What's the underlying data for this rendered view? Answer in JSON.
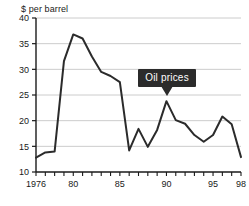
{
  "chart_data": {
    "type": "line",
    "title": "",
    "subtitle": "",
    "ylabel": "$ per barrel",
    "xlabel": "",
    "ylim": [
      10,
      40
    ],
    "xlim": [
      1976,
      1998
    ],
    "yticks": [
      10,
      15,
      20,
      25,
      30,
      35,
      40
    ],
    "ytick_labels": [
      "10",
      "15",
      "20",
      "25",
      "30",
      "35",
      "40"
    ],
    "xticks": [
      1976,
      1980,
      1985,
      1990,
      1995,
      1998
    ],
    "xtick_labels": [
      "1976",
      "80",
      "85",
      "90",
      "95",
      "98"
    ],
    "x_minor_ticks": [
      1976,
      1977,
      1978,
      1979,
      1980,
      1981,
      1982,
      1983,
      1984,
      1985,
      1986,
      1987,
      1988,
      1989,
      1990,
      1991,
      1992,
      1993,
      1994,
      1995,
      1996,
      1997,
      1998
    ],
    "grid": "horizontal",
    "legend": "none",
    "line_color": "#2b2b2b",
    "grid_color": "#cccccc",
    "axis_color": "#1a1a1a",
    "x": [
      1976,
      1977,
      1978,
      1979,
      1980,
      1981,
      1982,
      1983,
      1984,
      1985,
      1986,
      1987,
      1988,
      1989,
      1990,
      1991,
      1992,
      1993,
      1994,
      1995,
      1996,
      1997,
      1998
    ],
    "series": [
      {
        "name": "Oil prices",
        "values": [
          12.8,
          13.8,
          14.0,
          31.6,
          36.8,
          36.0,
          32.5,
          29.5,
          28.7,
          27.5,
          14.2,
          18.4,
          14.9,
          18.2,
          23.8,
          20.1,
          19.4,
          17.2,
          15.9,
          17.2,
          20.8,
          19.3,
          12.9
        ]
      }
    ],
    "annotations": [
      {
        "text": "Oil prices",
        "style": "dark-callout-box",
        "points_at_x": 1990,
        "text_color": "#ffffff",
        "background_color": "#2b2b2b"
      }
    ]
  },
  "annotation": {
    "label": "Oil prices"
  }
}
